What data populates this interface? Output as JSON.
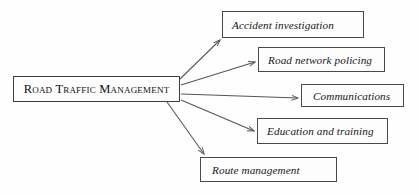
{
  "figure": {
    "type": "hierarchy-diagram",
    "background_color": "#fefefe",
    "line_color": "#4a4a4a",
    "text_color": "#171717"
  },
  "root": {
    "id": "road-traffic-management",
    "label": "Road Traffic Management"
  },
  "branches": [
    {
      "id": "accident-investigation",
      "label": "Accident investigation"
    },
    {
      "id": "road-network-policing",
      "label": "Road network policing"
    },
    {
      "id": "communications",
      "label": "Communications"
    },
    {
      "id": "education-and-training",
      "label": "Education and training"
    },
    {
      "id": "route-management",
      "label": "Route management"
    }
  ],
  "connectors": [
    {
      "from": "road-traffic-management",
      "to": "accident-investigation",
      "style": "arrow"
    },
    {
      "from": "road-traffic-management",
      "to": "road-network-policing",
      "style": "arrow"
    },
    {
      "from": "road-traffic-management",
      "to": "communications",
      "style": "arrow"
    },
    {
      "from": "road-traffic-management",
      "to": "education-and-training",
      "style": "arrow"
    },
    {
      "from": "road-traffic-management",
      "to": "route-management",
      "style": "arrow"
    }
  ]
}
